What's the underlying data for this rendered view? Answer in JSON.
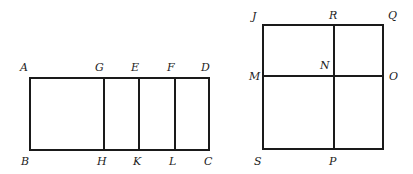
{
  "figures": [
    {
      "name": "rectangle-ABCD",
      "outer": {
        "x1": 30,
        "y1": 78,
        "x2": 209,
        "y2": 150
      },
      "dividers": [
        {
          "x1": 104,
          "y1": 78,
          "x2": 104,
          "y2": 150
        },
        {
          "x1": 139,
          "y1": 78,
          "x2": 139,
          "y2": 150
        },
        {
          "x1": 175,
          "y1": 78,
          "x2": 175,
          "y2": 150
        }
      ],
      "labels": {
        "A": "A",
        "G": "G",
        "E": "E",
        "F": "F",
        "D": "D",
        "B": "B",
        "H": "H",
        "K": "K",
        "L": "L",
        "C": "C"
      }
    },
    {
      "name": "square-JQPS",
      "outer": {
        "x1": 263,
        "y1": 25,
        "x2": 383,
        "y2": 149
      },
      "dividers": [
        {
          "x1": 334,
          "y1": 25,
          "x2": 334,
          "y2": 149
        },
        {
          "x1": 263,
          "y1": 76,
          "x2": 383,
          "y2": 76
        }
      ],
      "labels": {
        "J": "J",
        "R": "R",
        "Q": "Q",
        "M": "M",
        "N": "N",
        "O": "O",
        "S": "S",
        "P": "P"
      }
    }
  ],
  "colors": {
    "stroke": "#1a1a1a",
    "label": "#222222",
    "background": "#ffffff"
  }
}
